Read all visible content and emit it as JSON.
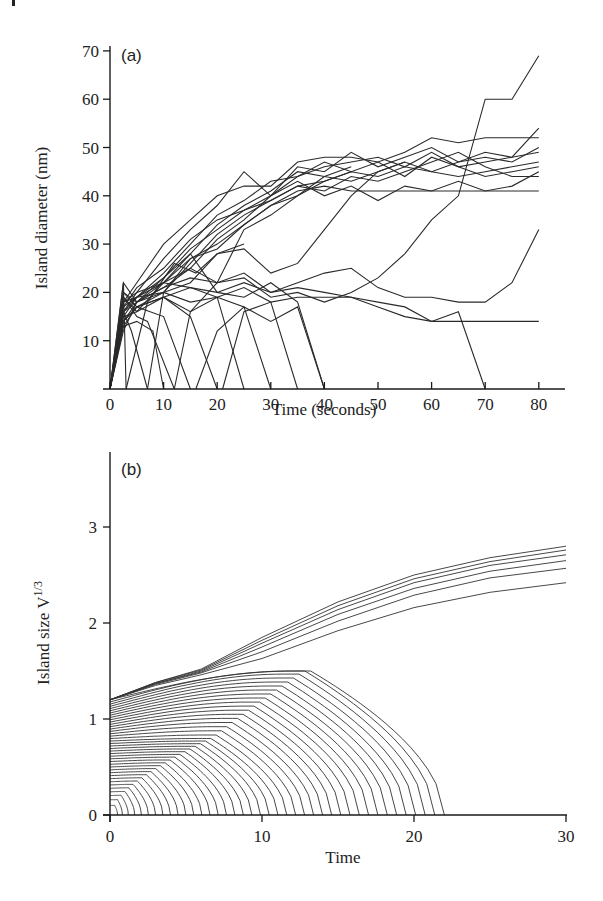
{
  "chart_data": [
    {
      "type": "line",
      "panel_label": "(a)",
      "title": "",
      "xlabel": "Time (seconds)",
      "ylabel": "Island diameter (nm)",
      "xlim": [
        0,
        85
      ],
      "ylim": [
        0,
        72
      ],
      "xticks": [
        0,
        10,
        20,
        30,
        40,
        50,
        60,
        70,
        80
      ],
      "yticks": [
        10,
        20,
        30,
        40,
        50,
        60,
        70
      ],
      "grid": false,
      "legend": null,
      "series": [
        {
          "name": "island-1",
          "x": [
            0,
            2.5,
            5,
            10,
            15,
            20,
            25,
            30,
            35,
            40,
            45,
            50,
            55,
            60,
            65,
            70,
            75,
            80
          ],
          "y": [
            0,
            18,
            22,
            30,
            35,
            40,
            42,
            42,
            47,
            48,
            48,
            47,
            49,
            52,
            51,
            52,
            52,
            52
          ]
        },
        {
          "name": "island-2",
          "x": [
            0,
            2.5,
            5,
            10,
            15,
            20,
            25,
            30,
            35,
            40,
            45,
            50,
            55,
            60,
            65,
            70,
            75,
            80
          ],
          "y": [
            0,
            16,
            20,
            27,
            33,
            38,
            45,
            40,
            46,
            45,
            49,
            46,
            48,
            50,
            47,
            49,
            48,
            49
          ]
        },
        {
          "name": "island-3",
          "x": [
            0,
            2.5,
            5,
            10,
            15,
            20,
            25,
            30,
            35,
            40,
            45,
            50,
            55,
            60,
            65,
            70,
            75,
            80
          ],
          "y": [
            0,
            15,
            19,
            24,
            30,
            36,
            39,
            43,
            44,
            47,
            45,
            47,
            44,
            48,
            46,
            44,
            45,
            46
          ]
        },
        {
          "name": "island-4",
          "x": [
            0,
            2.5,
            5,
            10,
            15,
            20,
            25,
            30,
            35,
            40,
            45,
            50,
            55,
            60,
            65,
            70,
            75,
            80
          ],
          "y": [
            0,
            14,
            18,
            22,
            28,
            34,
            38,
            41,
            45,
            44,
            43,
            45,
            47,
            45,
            44,
            45,
            46,
            47
          ]
        },
        {
          "name": "island-5",
          "x": [
            0,
            2.5,
            5,
            10,
            15,
            20,
            25,
            30,
            35,
            40,
            45,
            50,
            55,
            60,
            65,
            70,
            75,
            80
          ],
          "y": [
            0,
            13,
            17,
            20,
            26,
            32,
            36,
            39,
            42,
            41,
            44,
            43,
            45,
            47,
            49,
            46,
            44,
            44
          ]
        },
        {
          "name": "island-6",
          "x": [
            0,
            2.5,
            5,
            10,
            15,
            20,
            25,
            30,
            35,
            40,
            45,
            50,
            55,
            60,
            65,
            70,
            75,
            80
          ],
          "y": [
            0,
            17,
            21,
            25,
            31,
            35,
            37,
            40,
            43,
            40,
            42,
            39,
            42,
            41,
            43,
            41,
            42,
            45
          ]
        },
        {
          "name": "island-7",
          "x": [
            0,
            2.5,
            5,
            10,
            15,
            20,
            25,
            30,
            35,
            40,
            45,
            50,
            55,
            60,
            65,
            70,
            75,
            80
          ],
          "y": [
            0,
            19,
            16,
            22,
            27,
            30,
            34,
            38,
            41,
            42,
            41,
            41,
            41,
            41,
            41,
            41,
            41,
            41
          ]
        },
        {
          "name": "island-8",
          "x": [
            0,
            2.5,
            5,
            10,
            15,
            20,
            25,
            30,
            35,
            40,
            45,
            50,
            55,
            60,
            65,
            70,
            75,
            80
          ],
          "y": [
            0,
            20,
            18,
            23,
            29,
            33,
            37,
            39,
            42,
            43,
            45,
            44,
            46,
            45,
            47,
            48,
            47,
            50
          ]
        },
        {
          "name": "island-9",
          "x": [
            0,
            2.5,
            5,
            10,
            15,
            20,
            25,
            30,
            35,
            40,
            45,
            50,
            55,
            60,
            65,
            70,
            75,
            80
          ],
          "y": [
            0,
            12,
            18,
            21,
            25,
            31,
            35,
            40,
            44,
            46,
            47,
            48,
            46,
            49,
            46,
            47,
            48,
            54
          ]
        },
        {
          "name": "island-10",
          "x": [
            0,
            2.5,
            5,
            10,
            15,
            20,
            25,
            30,
            35,
            40,
            45,
            50,
            55
          ],
          "y": [
            0,
            22,
            18,
            20,
            22,
            28,
            29,
            24,
            26,
            33,
            40,
            45,
            47
          ]
        },
        {
          "name": "island-11",
          "x": [
            0,
            2.5,
            5,
            10,
            15,
            20,
            25,
            30,
            35,
            40,
            45,
            50,
            55,
            60,
            65,
            70,
            75,
            80
          ],
          "y": [
            0,
            16,
            19,
            22,
            25,
            22,
            23,
            19,
            20,
            18,
            20,
            23,
            28,
            35,
            40,
            60,
            60,
            69
          ]
        },
        {
          "name": "island-12",
          "x": [
            0,
            2.5,
            5,
            10,
            15,
            20,
            25,
            30,
            35,
            40,
            45,
            50,
            55,
            60,
            65,
            70,
            75,
            80
          ],
          "y": [
            0,
            14,
            17,
            19,
            21,
            20,
            22,
            20,
            22,
            24,
            25,
            21,
            19,
            19,
            18,
            18,
            22,
            33
          ]
        },
        {
          "name": "island-13",
          "x": [
            0,
            2.5,
            5,
            10,
            15,
            20,
            25,
            30,
            35,
            40,
            45,
            50,
            55,
            60,
            65,
            70,
            75,
            80
          ],
          "y": [
            0,
            18,
            19,
            20,
            18,
            19,
            21,
            18,
            19,
            19,
            19,
            18,
            17,
            14,
            14,
            14,
            14,
            14
          ]
        },
        {
          "name": "island-14",
          "x": [
            0,
            2.5,
            5,
            10,
            15,
            20,
            25,
            30,
            35,
            40,
            45,
            50,
            55,
            60,
            65,
            70
          ],
          "y": [
            0,
            16,
            18,
            21,
            23,
            22,
            24,
            20,
            21,
            20,
            19,
            17,
            15,
            14,
            16,
            0
          ]
        },
        {
          "name": "island-15",
          "x": [
            0,
            2.5,
            5,
            10,
            15,
            20,
            25,
            30,
            35,
            40
          ],
          "y": [
            0,
            17,
            19,
            23,
            28,
            20,
            19,
            22,
            18,
            0
          ]
        },
        {
          "name": "island-16",
          "x": [
            0,
            2.5,
            5,
            10,
            15,
            20,
            25,
            30
          ],
          "y": [
            0,
            18,
            20,
            22,
            21,
            19,
            17,
            0
          ]
        },
        {
          "name": "island-17",
          "x": [
            0,
            2.5,
            5,
            10,
            15,
            20,
            25
          ],
          "y": [
            0,
            20,
            17,
            19,
            16,
            19,
            0
          ]
        },
        {
          "name": "island-18",
          "x": [
            0,
            2.5,
            5,
            10,
            15,
            20
          ],
          "y": [
            0,
            15,
            16,
            19,
            15,
            0
          ]
        },
        {
          "name": "island-19",
          "x": [
            0,
            2.5,
            5,
            10,
            15
          ],
          "y": [
            0,
            14,
            17,
            15,
            0
          ]
        },
        {
          "name": "island-20",
          "x": [
            0,
            2.5,
            5,
            7,
            12
          ],
          "y": [
            0,
            19,
            15,
            14,
            0
          ]
        },
        {
          "name": "island-21",
          "x": [
            0,
            2.5,
            5,
            8,
            10
          ],
          "y": [
            0,
            13,
            14,
            12,
            0
          ]
        },
        {
          "name": "island-22",
          "x": [
            0,
            2.5,
            4,
            7
          ],
          "y": [
            0,
            16,
            12,
            0
          ]
        },
        {
          "name": "island-23",
          "x": [
            0,
            2.5,
            3
          ],
          "y": [
            0,
            22,
            0
          ]
        },
        {
          "name": "island-24",
          "x": [
            3,
            7,
            12,
            16,
            20,
            25
          ],
          "y": [
            0,
            18,
            26,
            24,
            28,
            30
          ]
        },
        {
          "name": "island-25",
          "x": [
            7,
            10,
            15,
            20,
            25,
            30,
            35,
            40,
            45
          ],
          "y": [
            0,
            20,
            27,
            29,
            34,
            38,
            40,
            44,
            46
          ]
        },
        {
          "name": "island-26",
          "x": [
            12,
            15,
            20,
            25,
            30,
            35,
            40,
            45
          ],
          "y": [
            0,
            16,
            22,
            33,
            36,
            40,
            43,
            45
          ]
        },
        {
          "name": "island-27",
          "x": [
            16,
            20,
            25,
            30,
            35,
            40
          ],
          "y": [
            0,
            12,
            17,
            14,
            17,
            0
          ]
        },
        {
          "name": "island-28",
          "x": [
            21,
            25,
            30,
            35
          ],
          "y": [
            0,
            16,
            18,
            0
          ]
        }
      ]
    },
    {
      "type": "line",
      "panel_label": "(b)",
      "title": "",
      "xlabel": "Time",
      "ylabel": "Island size V",
      "ylabel_superscript": "1/3",
      "xlim": [
        0,
        30
      ],
      "ylim": [
        0,
        3.75
      ],
      "xticks": [
        0,
        10,
        20,
        30
      ],
      "yticks": [
        0,
        1,
        2,
        3
      ],
      "grid": false,
      "legend": null,
      "description": "Simulated coarsening: ~6 surviving islands grow from ~1.2 to 2.4–2.8 by t=30; ~40 shrinking islands start at sizes 0.1–1.2, rise or fall and vanish between t≈0.5 and t≈22.",
      "growing_series": [
        {
          "name": "grow-1",
          "x": [
            0,
            3,
            6,
            10,
            15,
            20,
            25,
            30
          ],
          "y": [
            1.2,
            1.38,
            1.52,
            1.85,
            2.22,
            2.5,
            2.68,
            2.8
          ]
        },
        {
          "name": "grow-2",
          "x": [
            0,
            3,
            6,
            10,
            15,
            20,
            25,
            30
          ],
          "y": [
            1.2,
            1.38,
            1.51,
            1.82,
            2.18,
            2.46,
            2.64,
            2.76
          ]
        },
        {
          "name": "grow-3",
          "x": [
            0,
            3,
            6,
            10,
            15,
            20,
            25,
            30
          ],
          "y": [
            1.2,
            1.37,
            1.5,
            1.79,
            2.14,
            2.42,
            2.6,
            2.71
          ]
        },
        {
          "name": "grow-4",
          "x": [
            0,
            3,
            6,
            10,
            15,
            20,
            25,
            30
          ],
          "y": [
            1.2,
            1.37,
            1.49,
            1.75,
            2.09,
            2.36,
            2.54,
            2.65
          ]
        },
        {
          "name": "grow-5",
          "x": [
            0,
            3,
            6,
            10,
            15,
            20,
            25,
            30
          ],
          "y": [
            1.2,
            1.36,
            1.48,
            1.7,
            2.02,
            2.29,
            2.47,
            2.57
          ]
        },
        {
          "name": "grow-6",
          "x": [
            0,
            3,
            6,
            10,
            15,
            20,
            25,
            30
          ],
          "y": [
            1.2,
            1.35,
            1.46,
            1.63,
            1.92,
            2.16,
            2.32,
            2.42
          ]
        }
      ],
      "shrinking_summary": {
        "count": 40,
        "initial_size_range": [
          0.1,
          1.2
        ],
        "max_envelope_size": 1.5,
        "vanish_time_range": [
          0.5,
          22
        ]
      }
    }
  ]
}
